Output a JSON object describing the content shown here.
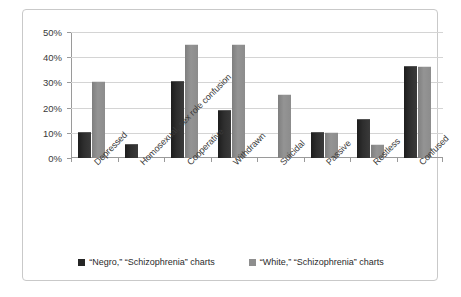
{
  "chart_data": {
    "type": "bar",
    "title": "",
    "subtitle": "",
    "xlabel": "",
    "ylabel": "",
    "ylim": [
      0,
      50
    ],
    "ytick_labels": [
      "0%",
      "10%",
      "20%",
      "30%",
      "40%",
      "50%"
    ],
    "ytick_values": [
      0,
      10,
      20,
      30,
      40,
      50
    ],
    "grid": true,
    "legend_position": "bottom-center",
    "categories": [
      "Depressed",
      "Homosexual, sex role confusion",
      "Cooperative",
      "Withdrawn",
      "Suicidal",
      "Passive",
      "Restless",
      "Confused"
    ],
    "series": [
      {
        "name": "“Negro,” “Schizophrenia” charts",
        "color": "#262626",
        "values": [
          10,
          5,
          30,
          18.5,
          0,
          10,
          15,
          36
        ]
      },
      {
        "name": "“White,” “Schizophrenia” charts",
        "color": "#8e8e8e",
        "values": [
          30,
          0,
          45,
          45,
          25,
          10,
          5,
          36
        ]
      }
    ]
  },
  "legend": {
    "items": [
      {
        "label": "“Negro,” “Schizophrenia” charts",
        "swatch": "dark"
      },
      {
        "label": "“White,” “Schizophrenia” charts",
        "swatch": "light"
      }
    ]
  }
}
